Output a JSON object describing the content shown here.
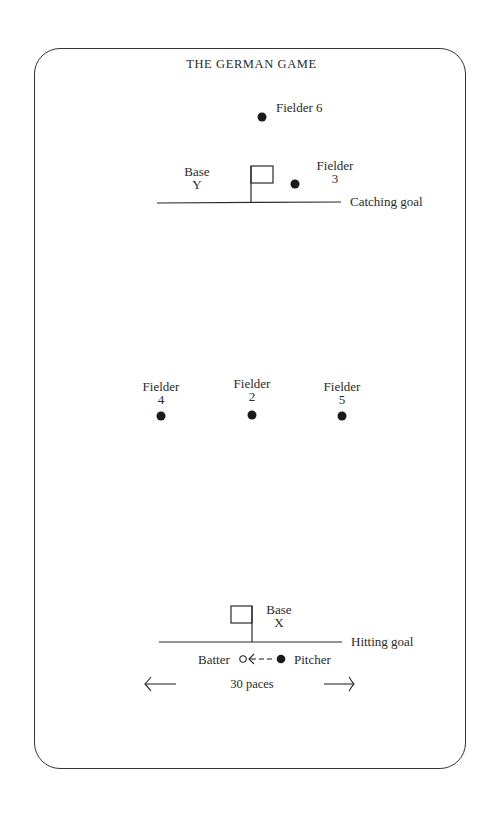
{
  "title": "THE GERMAN GAME",
  "fielders": {
    "f6": {
      "label": "Fielder",
      "num": "6"
    },
    "f3": {
      "label": "Fielder",
      "num": "3"
    },
    "f4": {
      "label": "Fielder",
      "num": "4"
    },
    "f2": {
      "label": "Fielder",
      "num": "2"
    },
    "f5": {
      "label": "Fielder",
      "num": "5"
    }
  },
  "fielder6_label": "Fielder  6",
  "base_y": {
    "line1": "Base",
    "line2": "Y"
  },
  "base_x": {
    "line1": "Base",
    "line2": "X"
  },
  "catching_goal": "Catching goal",
  "hitting_goal": "Hitting goal",
  "batter": "Batter",
  "pitcher": "Pitcher",
  "distance": "30 paces",
  "colors": {
    "ink": "#2a2a2a",
    "background": "#ffffff"
  }
}
